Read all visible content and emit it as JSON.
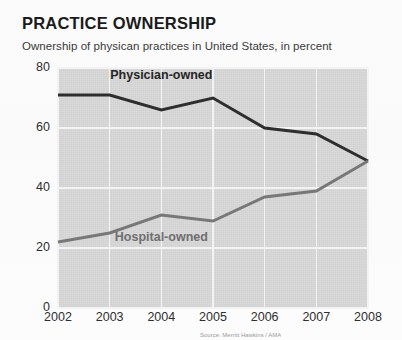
{
  "header": {
    "title": "PRACTICE OWNERSHIP",
    "subtitle": "Ownership of physican practices in United States, in percent"
  },
  "footer": {
    "source": "Source: Merritt Hawkins / AMA"
  },
  "chart_data": {
    "type": "line",
    "title": "PRACTICE OWNERSHIP",
    "subtitle": "Ownership of physican practices in United States, in percent",
    "xlabel": "",
    "ylabel": "",
    "categories": [
      "2002",
      "2003",
      "2004",
      "2005",
      "2006",
      "2007",
      "2008"
    ],
    "x": [
      2002,
      2003,
      2004,
      2005,
      2006,
      2007,
      2008
    ],
    "xlim": [
      2002,
      2008
    ],
    "ylim": [
      0,
      80
    ],
    "yticks": [
      0,
      20,
      40,
      60,
      80
    ],
    "ytick_labels": [
      "0",
      "20",
      "40",
      "60",
      "80"
    ],
    "grid": true,
    "legend": "inline-annotations",
    "series": [
      {
        "name": "Physician-owned",
        "color": "#2e2e2e",
        "values": [
          71,
          71,
          66,
          70,
          60,
          58,
          49
        ],
        "label_x": 2004.0,
        "label_y": 77
      },
      {
        "name": "Hospital-owned",
        "color": "#787878",
        "values": [
          22,
          25,
          31,
          29,
          37,
          39,
          49
        ],
        "label_x": 2004.0,
        "label_y": 23
      }
    ],
    "annotations": [
      {
        "text": "Physician-owned",
        "series": "Physician-owned"
      },
      {
        "text": "Hospital-owned",
        "series": "Hospital-owned"
      }
    ],
    "colors": {
      "plot_background": "#d8d8d8",
      "gridlines": "#f3f3f3",
      "physician_line": "#2e2e2e",
      "hospital_line": "#787878",
      "page_background": "#fdfdfd",
      "title_text": "#1b1b1b",
      "axis_text": "#2f2f2f"
    }
  }
}
